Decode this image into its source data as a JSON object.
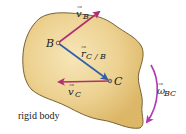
{
  "diagram": {
    "body_label": "rigid body",
    "points": [
      {
        "id": "B",
        "label": "B",
        "x": 58,
        "y": 43
      },
      {
        "id": "C",
        "label": "C",
        "x": 110,
        "y": 81
      }
    ],
    "vectors": [
      {
        "id": "v_B",
        "label": "v",
        "subscript": "B",
        "color": "#b0306e",
        "from": [
          58,
          43
        ],
        "to": [
          101,
          10
        ]
      },
      {
        "id": "r_CB",
        "label": "r",
        "subscript": "C / B",
        "color": "#2f5fa8",
        "from": [
          58,
          43
        ],
        "to": [
          110,
          81
        ]
      },
      {
        "id": "v_C",
        "label": "v",
        "subscript": "C",
        "color": "#b0306e",
        "from": [
          110,
          81
        ],
        "to": [
          56,
          82
        ]
      },
      {
        "id": "omega_BC",
        "label": "ω",
        "subscript": "BC",
        "color": "#b03ab0",
        "type": "angular-arc"
      }
    ],
    "colors": {
      "body_fill": "#e8c77e",
      "body_fill_light": "#f6e3b4",
      "body_outline": "#6b5326",
      "velocity": "#b0306e",
      "position": "#2f5fa8",
      "angular": "#b03ab0"
    }
  }
}
